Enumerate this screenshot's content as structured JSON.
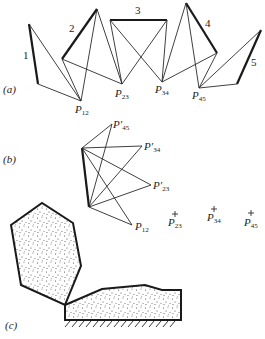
{
  "figure": {
    "part_a": {
      "label": "(a)",
      "link_labels": [
        "1",
        "2",
        "3",
        "4",
        "5"
      ],
      "poles": [
        {
          "name": "P",
          "sub": "12"
        },
        {
          "name": "P",
          "sub": "23"
        },
        {
          "name": "P",
          "sub": "34"
        },
        {
          "name": "P",
          "sub": "45"
        }
      ]
    },
    "part_b": {
      "label": "(b)",
      "image_poles": [
        {
          "name": "P′",
          "sub": "45"
        },
        {
          "name": "P′",
          "sub": "34"
        },
        {
          "name": "P′",
          "sub": "23"
        },
        {
          "name": "P",
          "sub": "12"
        }
      ],
      "crosses": [
        {
          "name": "P",
          "sub": "23"
        },
        {
          "name": "P",
          "sub": "34"
        },
        {
          "name": "P",
          "sub": "45"
        }
      ]
    },
    "part_c": {
      "label": "(c)"
    }
  }
}
